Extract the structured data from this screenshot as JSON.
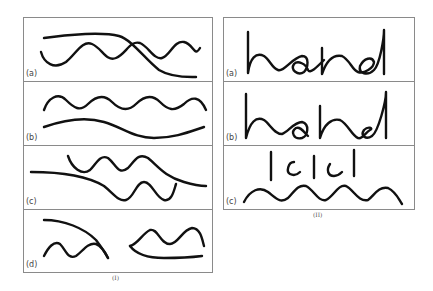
{
  "figure_I": {
    "caption": "(I)",
    "rows": [
      {
        "label": "(a)",
        "description": "smooth line crossing over a wavy line"
      },
      {
        "label": "(b)",
        "description": "wavy line above a smooth curve"
      },
      {
        "label": "(c)",
        "description": "smooth line continuing into wavy lines, split"
      },
      {
        "label": "(d)",
        "description": "two separated pairs of arc and wave"
      }
    ]
  },
  "figure_II": {
    "caption": "(II)",
    "rows": [
      {
        "label": "(a)",
        "text": "hand"
      },
      {
        "label": "(b)",
        "text": "hand"
      },
      {
        "label": "(c)",
        "text": "lclcl",
        "description": "vertical strokes and c-shapes above a wavy line"
      }
    ]
  },
  "colors": {
    "stroke": "#111111",
    "border": "#8a8a8a",
    "background": "#ffffff"
  }
}
